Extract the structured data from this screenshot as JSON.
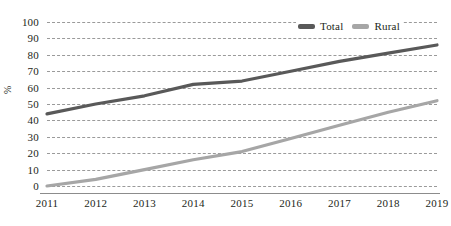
{
  "chart_data": {
    "type": "line",
    "title": "",
    "xlabel": "",
    "ylabel": "%",
    "categories": [
      "2011",
      "2012",
      "2013",
      "2014",
      "2015",
      "2016",
      "2017",
      "2018",
      "2019"
    ],
    "x": [
      2011,
      2012,
      2013,
      2014,
      2015,
      2016,
      2017,
      2018,
      2019
    ],
    "series": [
      {
        "name": "Total",
        "color": "#595959",
        "values": [
          44,
          50,
          55,
          62,
          64,
          70,
          76,
          81,
          86
        ]
      },
      {
        "name": "Rural",
        "color": "#a6a6a6",
        "values": [
          0,
          4,
          10,
          16,
          21,
          29,
          37,
          45,
          52
        ]
      }
    ],
    "ylim": [
      0,
      100
    ],
    "yticks": [
      0,
      10,
      20,
      30,
      40,
      50,
      60,
      70,
      80,
      90,
      100
    ],
    "ytick_labels": [
      "0",
      "10",
      "20",
      "30",
      "40",
      "50",
      "60",
      "70",
      "80",
      "90",
      "100"
    ],
    "grid": "horizontal-dashed",
    "legend_position": "top-right"
  },
  "legend": {
    "items": [
      {
        "label": "Total",
        "color": "#595959"
      },
      {
        "label": "Rural",
        "color": "#a6a6a6"
      }
    ]
  }
}
